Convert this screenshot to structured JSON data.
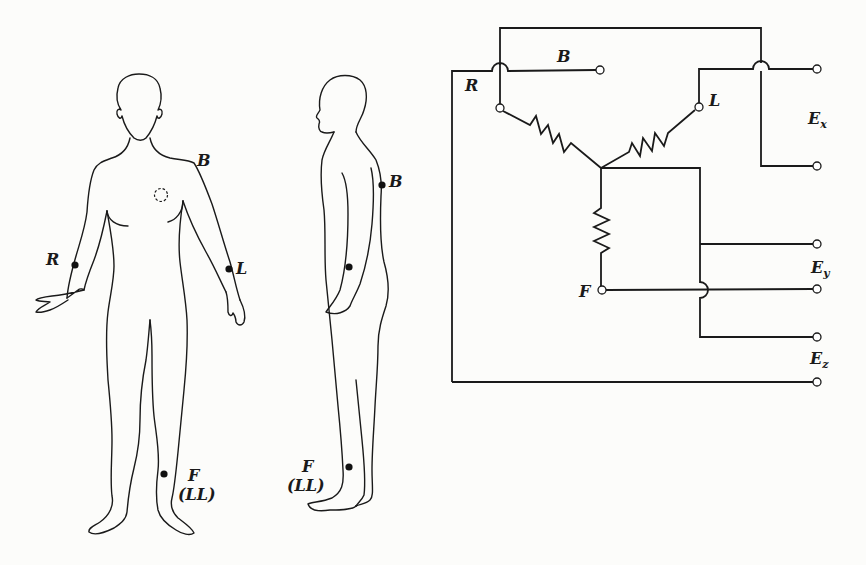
{
  "figure": {
    "front_view": {
      "electrode_labels": {
        "B": "B",
        "R": "R",
        "L": "L",
        "F": "F",
        "LL": "(LL)"
      }
    },
    "side_view": {
      "electrode_labels": {
        "B": "B",
        "F": "F",
        "LL": "(LL)"
      }
    },
    "circuit": {
      "inputs": {
        "R": "R",
        "B": "B",
        "L": "L",
        "F": "F"
      },
      "outputs": {
        "Ex": {
          "main": "E",
          "sub": "x"
        },
        "Ey": {
          "main": "E",
          "sub": "y"
        },
        "Ez": {
          "main": "E",
          "sub": "z"
        }
      }
    }
  },
  "colors": {
    "ink": "#1a1a1a",
    "paper": "#fcfcfa"
  }
}
